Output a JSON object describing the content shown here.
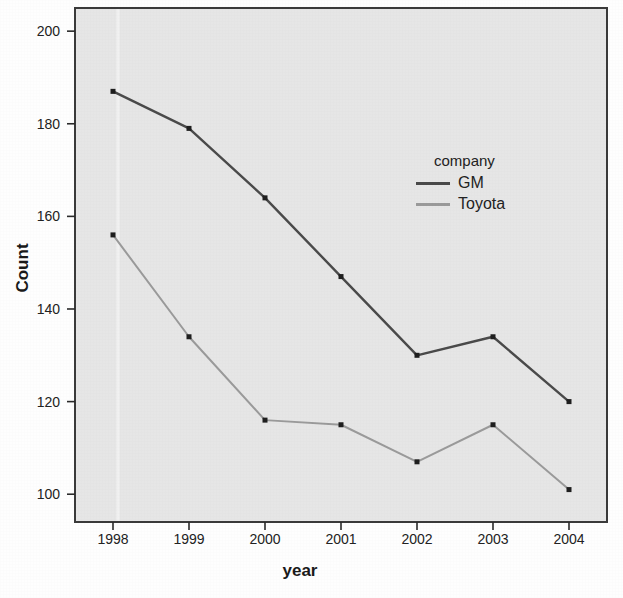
{
  "chart_data": {
    "type": "line",
    "title": "",
    "xlabel": "year",
    "ylabel": "Count",
    "categories": [
      "1998",
      "1999",
      "2000",
      "2001",
      "2002",
      "2003",
      "2004"
    ],
    "x": [
      1998,
      1999,
      2000,
      2001,
      2002,
      2003,
      2004
    ],
    "series": [
      {
        "name": "GM",
        "color": "#4a4a4a",
        "values": [
          187,
          179,
          164,
          147,
          130,
          134,
          120
        ]
      },
      {
        "name": "Toyota",
        "color": "#9a9a9a",
        "values": [
          156,
          134,
          116,
          115,
          107,
          115,
          101
        ]
      }
    ],
    "legend": {
      "title": "company",
      "position": "inside-right",
      "entries": [
        "GM",
        "Toyota"
      ]
    },
    "yticks": [
      100,
      120,
      140,
      160,
      180,
      200
    ],
    "ytick_labels": [
      "100",
      "120",
      "140",
      "160",
      "180",
      "200"
    ],
    "xtick_labels": [
      "1998",
      "1999",
      "2000",
      "2001",
      "2002",
      "2003",
      "2004"
    ],
    "ylim": [
      94,
      205
    ],
    "grid": false,
    "plot_background": "#e6e6e6",
    "frame_color": "#3a3a3a",
    "marker": "square"
  },
  "plot_geometry": {
    "left": 75,
    "top": 8,
    "right": 607,
    "bottom": 522
  }
}
